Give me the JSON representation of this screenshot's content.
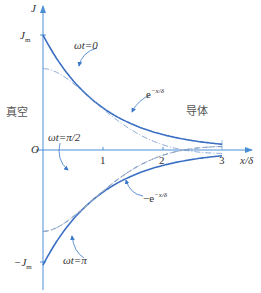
{
  "diagram": {
    "axis": {
      "y_label": "J",
      "x_label": "x/δ",
      "origin": "O"
    },
    "y_ticks": {
      "top": "J",
      "top_sub": "m",
      "bottom": "−J",
      "bottom_sub": "m"
    },
    "x_ticks": [
      "1",
      "2",
      "3"
    ],
    "regions": {
      "left": "真空",
      "right": "导体"
    },
    "curve_labels": {
      "wt0": "ωt=0",
      "wt_half_pi": "ωt=π/2",
      "wt_pi": "ωt=π",
      "env_pos": "e",
      "env_pos_exp": "−x/δ",
      "env_neg": "−e",
      "env_neg_exp": "−x/δ"
    },
    "colors": {
      "axis": "#4a8fd6",
      "envelope": "#3a6fc4",
      "dashed": "#a9b4c2",
      "text": "#333333"
    }
  },
  "chart_data": {
    "type": "line",
    "title": "",
    "xlabel": "x/δ",
    "ylabel": "J",
    "xlim": [
      0,
      3
    ],
    "ylim": [
      -1,
      1
    ],
    "series": [
      {
        "name": "e^{-x/δ}",
        "style": "solid"
      },
      {
        "name": "-e^{-x/δ}",
        "style": "solid"
      },
      {
        "name": "ωt=0",
        "style": "dash-dot"
      },
      {
        "name": "ωt=π/2",
        "style": "dashed"
      },
      {
        "name": "ωt=π",
        "style": "dash-dot"
      }
    ],
    "annotations": [
      "J_m",
      "-J_m",
      "O",
      "真空",
      "导体"
    ]
  }
}
